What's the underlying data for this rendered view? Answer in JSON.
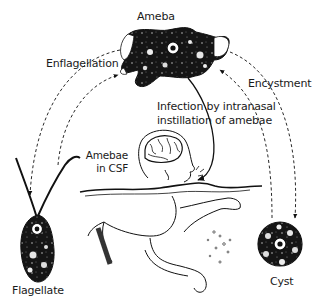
{
  "diagram": {
    "type": "life-cycle",
    "stages": [
      {
        "id": "ameba",
        "label": "Ameba"
      },
      {
        "id": "flagellate",
        "label": "Flagellate"
      },
      {
        "id": "cyst",
        "label": "Cyst"
      },
      {
        "id": "human",
        "label": "Amebae in CSF"
      }
    ],
    "labels": {
      "ameba": "Ameba",
      "enflagellation": "Enflagellation",
      "encystment": "Encystment",
      "infection_line1": "Infection by intranasal",
      "infection_line2": "instillation of amebae",
      "amebae_line1": "Amebae",
      "amebae_line2": "in CSF",
      "flagellate": "Flagellate",
      "cyst": "Cyst"
    },
    "transitions": [
      {
        "from": "ameba",
        "to": "flagellate",
        "label": "Enflagellation",
        "style": "dashed"
      },
      {
        "from": "flagellate",
        "to": "ameba",
        "style": "dashed"
      },
      {
        "from": "ameba",
        "to": "cyst",
        "label": "Encystment",
        "style": "dashed"
      },
      {
        "from": "cyst",
        "to": "ameba",
        "style": "dashed"
      },
      {
        "from": "ameba",
        "to": "human",
        "label": "Infection by intranasal instillation of amebae",
        "style": "solid"
      }
    ],
    "colors": {
      "ink": "#111111",
      "background": "#ffffff"
    }
  }
}
